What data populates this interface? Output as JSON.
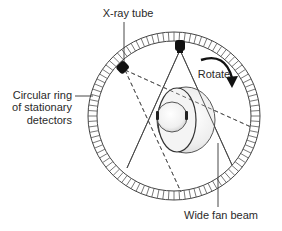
{
  "diagram": {
    "labels": {
      "xray_tube": "X-ray tube",
      "rotate": "Rotate",
      "ring_line1": "Circular ring",
      "ring_line2": "of stationary",
      "ring_line3": "detectors",
      "fan_beam": "Wide fan beam"
    },
    "colors": {
      "line": "#333333",
      "ring_stroke": "#444444",
      "tube": "#111111",
      "head_fill": "#e8e8e8",
      "head_highlight": "#ffffff",
      "text": "#2a2a2a"
    },
    "icons": {
      "xray_tube_icon": "filled-rounded-rectangle",
      "rotate_arrow_icon": "curved-arrow-clockwise",
      "patient_head_icon": "cutaway-sphere"
    }
  }
}
